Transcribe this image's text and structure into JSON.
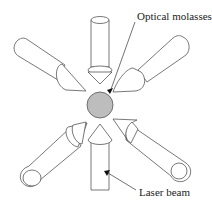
{
  "diagram": {
    "labels": {
      "optical_molasses": "Optical molasses",
      "laser_beam": "Laser beam"
    },
    "beam_count": 6,
    "colors": {
      "sphere_fill": "#bdbdbd",
      "sphere_stroke": "#555555",
      "beam_stroke": "#555555",
      "background": "#ffffff"
    }
  }
}
